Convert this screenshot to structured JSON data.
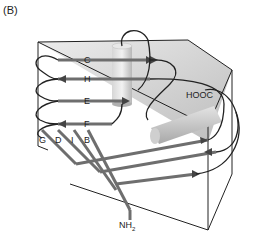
{
  "panel_label": "(B)",
  "strand_labels": {
    "C": "C",
    "H": "H",
    "E": "E",
    "F": "F",
    "G": "G",
    "D": "D",
    "I": "I",
    "B": "B"
  },
  "terminus": {
    "c_terminus": "HOOC",
    "n_terminus_main": "NH",
    "n_terminus_sub": "2"
  },
  "colors": {
    "strand": "#6e6e6e",
    "loop": "#222222",
    "sheet_face": "#d9d9d9",
    "cylinder": "#c8c8c8",
    "box_edge": "#222222"
  }
}
